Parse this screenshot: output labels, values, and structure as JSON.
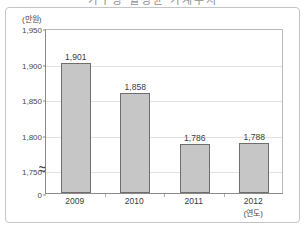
{
  "title": {
    "text": "가구당 월평균 가계수지"
  },
  "chart_data": {
    "type": "bar",
    "title": "가구당 월평균 가계수지",
    "categories": [
      "2009",
      "2010",
      "2011",
      "2012"
    ],
    "values": [
      1901,
      1858,
      1786,
      1788
    ],
    "value_labels": [
      "1,901",
      "1,858",
      "1,786",
      "1,788"
    ],
    "xlabel": "(연도)",
    "ylabel": "(만원)",
    "ylim": [
      1700,
      1950
    ],
    "y_ticks": [
      1950,
      1900,
      1850,
      1800,
      1750
    ],
    "y_tick_labels": [
      "1,950",
      "1,900",
      "1,850",
      "1,800",
      "1,750"
    ],
    "y_zero_label": "0",
    "axis_break": true,
    "axis_break_symbol": "≈",
    "grid": true,
    "legend": "none",
    "bar_fill_color": "#c6c6c6",
    "bar_border_color": "#6e6e6e",
    "grid_color": "#e2e2e2",
    "axis_color": "#8a8a8a"
  }
}
